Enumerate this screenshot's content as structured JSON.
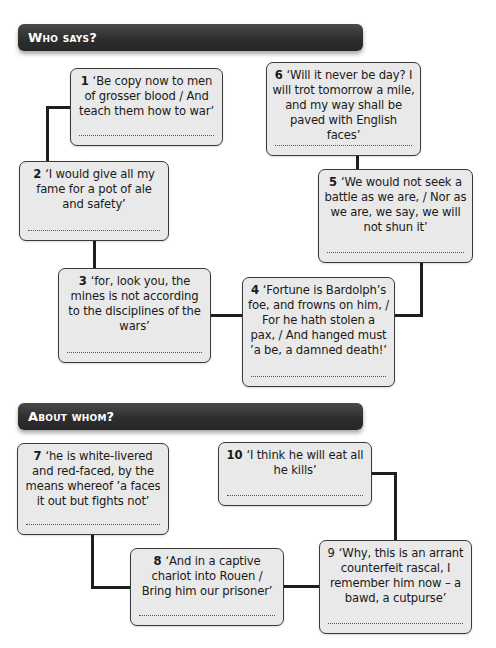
{
  "sections": [
    {
      "title": "Who says?"
    },
    {
      "title": "About whom?"
    }
  ],
  "who_says": [
    {
      "number": "1",
      "quote": "‘Be copy now to men of grosser blood / And teach them how to war’",
      "answer": ""
    },
    {
      "number": "2",
      "quote": "‘I would give all my fame for a pot of ale and safety’",
      "answer": ""
    },
    {
      "number": "3",
      "quote": "‘for, look you, the mines is not according to the disciplines of the wars’",
      "answer": ""
    },
    {
      "number": "4",
      "quote": "‘Fortune is Bardolph’s foe, and frowns on him, / For he hath stolen a pax, / And hanged must ’a be, a damned death!’",
      "answer": ""
    },
    {
      "number": "5",
      "quote": "‘We would not seek a battle as we are, / Nor as we are, we say, we will not shun it’",
      "answer": ""
    },
    {
      "number": "6",
      "quote": "‘Will it never be day? I will trot tomorrow a mile, and my way shall be paved with English faces’",
      "answer": ""
    }
  ],
  "about_whom": [
    {
      "number": "7",
      "quote": "‘he is white-livered and red-faced, by the means whereof ’a faces it out but fights not’",
      "answer": ""
    },
    {
      "number": "8",
      "quote": "‘And in a captive chariot into Rouen / Bring him our prisoner’",
      "answer": ""
    },
    {
      "number": "9",
      "quote": "‘Why, this is an arrant counterfeit rascal, I remember him now – a bawd, a cutpurse’",
      "answer": ""
    },
    {
      "number": "10",
      "quote": "‘I think he will eat all he kills’",
      "answer": ""
    }
  ],
  "colors": {
    "banner": "#2e2e2e",
    "box_fill": "#e9e9e9",
    "box_border": "#3a3a3a",
    "connector": "#1e1e1e"
  }
}
